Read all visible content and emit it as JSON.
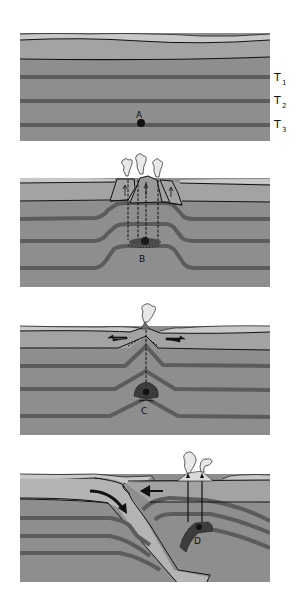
{
  "figure": {
    "panel_count": 4,
    "colors": {
      "background": "#ffffff",
      "surface_light": "#c8c8c8",
      "upper_layer": "#a3a3a3",
      "rock": "#8e8e8e",
      "dark_band": "#5c5c5c",
      "line": "#111111",
      "magma": "#1a1a1a",
      "slab": "#b4b4b4"
    },
    "side_labels": {
      "t1": {
        "main": "T",
        "sub": "1"
      },
      "t2": {
        "main": "T",
        "sub": "2"
      },
      "t3": {
        "main": "T",
        "sub": "3"
      }
    },
    "panels": [
      {
        "id": "panel-1",
        "setting": "undisturbed crust",
        "point_label": "A"
      },
      {
        "id": "panel-2",
        "setting": "hot spot volcanism with uplift",
        "point_label": "B"
      },
      {
        "id": "panel-3",
        "setting": "divergent boundary / rift",
        "point_label": "C"
      },
      {
        "id": "panel-4",
        "setting": "subduction zone",
        "point_label": "D"
      }
    ]
  }
}
